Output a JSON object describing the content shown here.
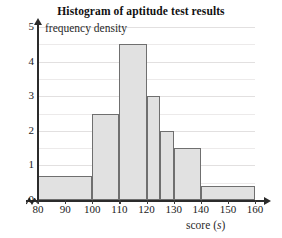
{
  "chart_data": {
    "type": "bar",
    "title": "Histogram of aptitude test results",
    "xlabel": "score (s)",
    "ylabel": "frequency density",
    "xlim": [
      80,
      160
    ],
    "ylim": [
      0,
      5
    ],
    "grid": true,
    "legend": "none",
    "x_ticks": [
      80,
      90,
      100,
      110,
      120,
      130,
      140,
      150,
      160
    ],
    "y_ticks": [
      0,
      1,
      2,
      3,
      4,
      5
    ],
    "x_axis_broken_at_origin": true,
    "bars": [
      {
        "label": "80-100",
        "x_start": 80,
        "x_end": 100,
        "value": 0.7,
        "frequency": 14
      },
      {
        "label": "100-110",
        "x_start": 100,
        "x_end": 110,
        "value": 2.5,
        "frequency": 25
      },
      {
        "label": "110-120",
        "x_start": 110,
        "x_end": 120,
        "value": 4.5,
        "frequency": 45
      },
      {
        "label": "120-125",
        "x_start": 120,
        "x_end": 125,
        "value": 3.0,
        "frequency": 15
      },
      {
        "label": "125-130",
        "x_start": 125,
        "x_end": 130,
        "value": 2.0,
        "frequency": 10
      },
      {
        "label": "130-140",
        "x_start": 130,
        "x_end": 140,
        "value": 1.5,
        "frequency": 15
      },
      {
        "label": "140-160",
        "x_start": 140,
        "x_end": 160,
        "value": 0.4,
        "frequency": 8
      }
    ],
    "colors": {
      "bar_fill": "#e1e1e1",
      "bar_stroke": "#6f6f6f",
      "axis": "#2b2b2b",
      "gridline": "#eceaea",
      "text": "#1a1a1a"
    }
  }
}
